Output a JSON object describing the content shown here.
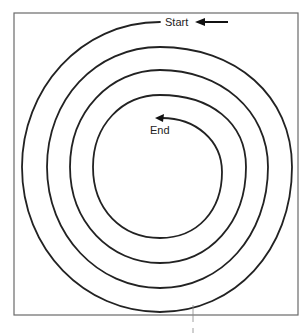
{
  "diagram": {
    "type": "spiral",
    "loops": 4,
    "direction": "counter-clockwise, inward",
    "start_label": "Start",
    "end_label": "End",
    "colors": {
      "stroke": "#222222",
      "frame": "#6a6a6a",
      "background": "#ffffff"
    }
  }
}
